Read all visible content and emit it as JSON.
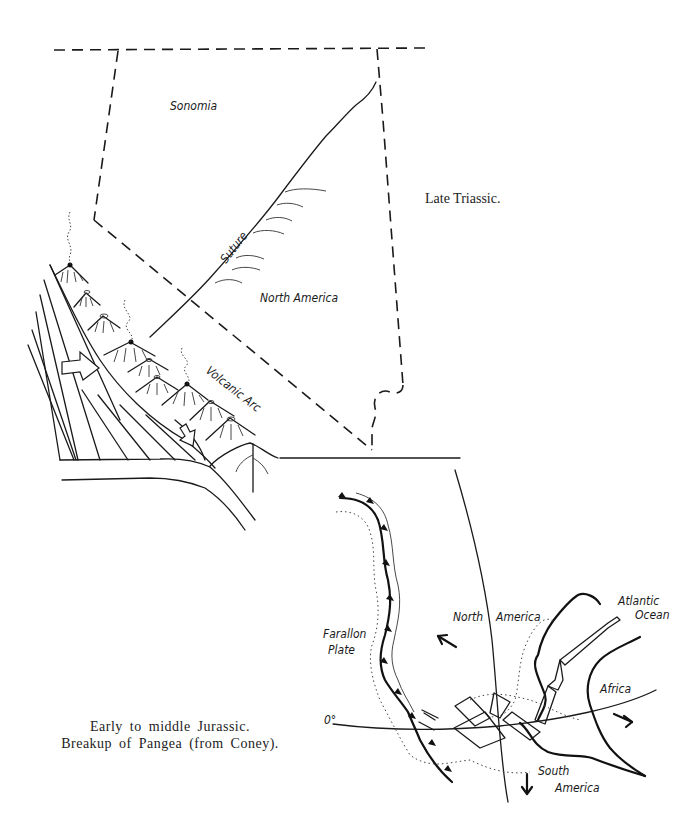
{
  "figure_top": {
    "title": "Late Triassic.",
    "labels": {
      "sonomia": "Sonomia",
      "suture": "Suture",
      "north_america": "North America",
      "volcanic_arc": "Volcanic Arc"
    }
  },
  "figure_bottom": {
    "caption_line1": "Early to middle Jurassic.",
    "caption_line2": "Breakup of Pangea (from Coney).",
    "labels": {
      "farallon_line1": "Farallon",
      "farallon_line2": "Plate",
      "north": "North",
      "america": "America",
      "atlantic_line1": "Atlantic",
      "atlantic_line2": "Ocean",
      "africa": "Africa",
      "south_line1": "South",
      "south_line2": "America",
      "equator": "0°"
    }
  }
}
